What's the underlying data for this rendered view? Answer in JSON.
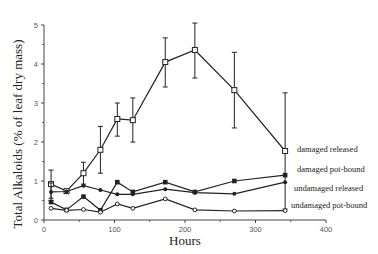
{
  "chart_data": {
    "type": "line",
    "title": "",
    "xlabel": "Hours",
    "ylabel": "Total Alkaloids (% of leaf dry mass)",
    "xlim": [
      0,
      400
    ],
    "ylim": [
      0,
      5
    ],
    "xticks": [
      0,
      100,
      200,
      300,
      400
    ],
    "yticks": [
      0,
      1,
      2,
      3,
      4,
      5
    ],
    "grid": false,
    "legend_position": "right, inline labels at series end",
    "x": [
      10,
      32,
      56,
      80,
      104,
      126,
      172,
      214,
      270,
      342
    ],
    "series": [
      {
        "name": "damaged released",
        "marker": "open-square",
        "values": [
          0.92,
          0.74,
          1.2,
          1.8,
          2.59,
          2.56,
          4.05,
          4.36,
          3.33,
          1.77
        ],
        "error_upper": [
          1.28,
          0.74,
          1.48,
          2.4,
          3.0,
          3.13,
          4.67,
          5.05,
          4.3,
          3.26
        ],
        "error_lower": [
          0.56,
          0.74,
          0.92,
          1.2,
          2.15,
          2.0,
          3.41,
          3.64,
          2.36,
          0.28
        ]
      },
      {
        "name": "damaged pot-bound",
        "marker": "filled-square",
        "values": [
          0.46,
          0.26,
          0.6,
          0.25,
          0.97,
          0.72,
          0.97,
          0.72,
          1.0,
          1.15
        ]
      },
      {
        "name": "undamaged released",
        "marker": "filled-diamond",
        "values": [
          0.72,
          0.73,
          0.88,
          0.77,
          0.66,
          0.66,
          0.79,
          0.7,
          0.67,
          0.97
        ],
        "error_upper": [
          0.95,
          null,
          null,
          null,
          null,
          null,
          null,
          null,
          null,
          null
        ],
        "error_lower": [
          0.5,
          null,
          null,
          null,
          null,
          null,
          null,
          null,
          null,
          null
        ]
      },
      {
        "name": "undamaged pot-bound",
        "marker": "open-diamond",
        "values": [
          0.3,
          0.25,
          0.27,
          0.2,
          0.41,
          0.3,
          0.54,
          0.26,
          0.23,
          0.24
        ]
      }
    ]
  },
  "legend": {
    "labels": [
      {
        "text": "damaged released",
        "x": 297,
        "y": 152
      },
      {
        "text": "damaged pot-bound",
        "x": 297,
        "y": 172
      },
      {
        "text": "undamaged released",
        "x": 294,
        "y": 191
      },
      {
        "text": "undamaged pot-bound",
        "x": 291,
        "y": 208
      }
    ]
  },
  "layout": {
    "plot_left": 44,
    "plot_right": 326,
    "plot_top": 25,
    "plot_bottom": 220,
    "line_color": "#222222",
    "axis_color": "#444444"
  }
}
